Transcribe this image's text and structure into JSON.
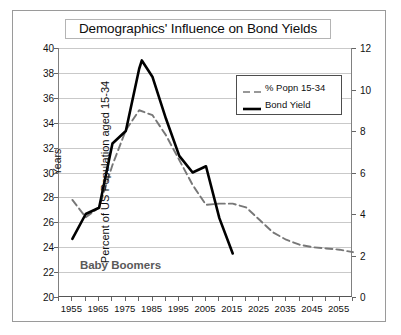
{
  "chart_data": {
    "type": "line",
    "title": "Demographics' Influence on Bond Yields",
    "xlabel": "Years",
    "ylabel": "Percent of US Population aged 15-34",
    "ylabel_right": "US 10 Year Bond Yield - Percent",
    "xlim": [
      1950,
      2060
    ],
    "ylim": [
      20,
      40
    ],
    "ylim_right": [
      0,
      12
    ],
    "grid": true,
    "legend_position": "upper right",
    "x_ticks": [
      1955,
      1965,
      1975,
      1985,
      1995,
      2005,
      2015,
      2025,
      2035,
      2045,
      2055
    ],
    "x_minor_tick_step": 5,
    "y_ticks_left": [
      20,
      22,
      24,
      26,
      28,
      30,
      32,
      34,
      36,
      38,
      40
    ],
    "y_ticks_right": [
      0,
      2,
      4,
      6,
      8,
      10,
      12
    ],
    "annotations": [
      {
        "text": "Baby Boomers",
        "x": 1973,
        "y": 22.4
      }
    ],
    "series": [
      {
        "name": "% Popn 15-34",
        "axis": "left",
        "style": "dashed",
        "color": "#777777",
        "x": [
          1955,
          1960,
          1965,
          1970,
          1975,
          1980,
          1985,
          1990,
          1995,
          2000,
          2005,
          2010,
          2015,
          2020,
          2025,
          2030,
          2035,
          2040,
          2045,
          2050,
          2055,
          2060
        ],
        "values": [
          27.8,
          26.4,
          27.2,
          30.6,
          33.4,
          35.0,
          34.6,
          33.0,
          31.0,
          29.0,
          27.4,
          27.5,
          27.5,
          27.2,
          26.2,
          25.2,
          24.6,
          24.2,
          24.0,
          23.9,
          23.8,
          23.6
        ]
      },
      {
        "name": "Bond Yield",
        "axis": "right",
        "style": "solid",
        "color": "#000000",
        "x": [
          1955,
          1960,
          1965,
          1970,
          1975,
          1980,
          1981,
          1985,
          1990,
          1995,
          2000,
          2005,
          2010,
          2015
        ],
        "values": [
          2.8,
          4.0,
          4.3,
          7.4,
          8.0,
          11.0,
          11.4,
          10.6,
          8.6,
          6.8,
          6.0,
          6.3,
          3.8,
          2.1
        ]
      }
    ]
  },
  "legend": {
    "items": [
      {
        "label": "% Popn 15-34",
        "style": "dashed",
        "color": "#777777"
      },
      {
        "label": "Bond Yield",
        "style": "solid",
        "color": "#000000"
      }
    ]
  }
}
